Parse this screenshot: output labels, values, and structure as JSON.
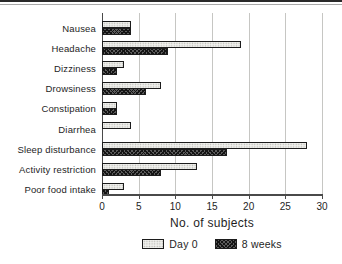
{
  "chart_data": {
    "type": "bar",
    "orientation": "horizontal",
    "title": "",
    "xlabel": "No. of subjects",
    "categories": [
      "Nausea",
      "Headache",
      "Dizziness",
      "Drowsiness",
      "Constipation",
      "Diarrhea",
      "Sleep disturbance",
      "Activity restriction",
      "Poor food intake"
    ],
    "series": [
      {
        "name": "Day 0",
        "pattern": "stipple",
        "color": "#f0f0ed",
        "values": [
          4,
          19,
          3,
          8,
          2,
          4,
          28,
          13,
          3
        ]
      },
      {
        "name": "8 weeks",
        "pattern": "crosshatch",
        "color": "#4a4a4a",
        "values": [
          4,
          9,
          2,
          6,
          2,
          0,
          17,
          8,
          1
        ]
      }
    ],
    "xlim": [
      0,
      30
    ],
    "xticks": [
      0,
      5,
      10,
      15,
      20,
      25,
      30
    ],
    "grid": true,
    "legend_position": "bottom"
  }
}
